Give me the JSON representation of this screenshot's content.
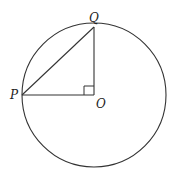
{
  "diagram": {
    "labels": {
      "P": "P",
      "Q": "Q",
      "O": "O"
    },
    "stroke_color": "#333333"
  }
}
